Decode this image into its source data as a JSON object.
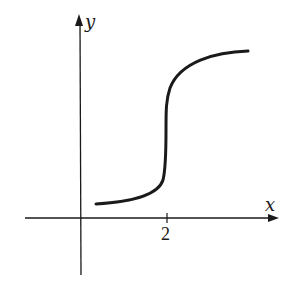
{
  "diagram": {
    "type": "function-graph",
    "axes": {
      "x_label": "x",
      "y_label": "y",
      "tick_labels": [
        "2"
      ]
    },
    "curve": {
      "description": "Increasing curve with vertical tangent (inflection point) at x = 2; concave up for x < 2, concave down for x > 2",
      "vertical_tangent_at_x": 2
    },
    "colors": {
      "stroke": "#1a1a1a",
      "background": "#ffffff"
    }
  }
}
